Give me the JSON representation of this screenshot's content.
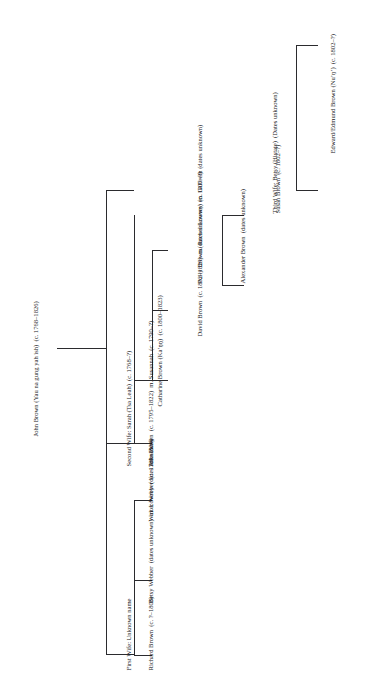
{
  "figure": {
    "type": "genealogy-tree",
    "orientation": "rotated-90-ccw",
    "background_color": "#ffffff",
    "line_color": "#2b2b2e"
  },
  "nodes": {
    "root": {
      "name": "John Brown",
      "native_name": "Yau na gung yah ish",
      "dates": "(c. 1768–1826)"
    },
    "wife1": {
      "label": "First Wife: Unknown name"
    },
    "wife2": {
      "name": "Second Wife: Sarah",
      "native_name": "Tsa Leah",
      "dates": "(c. 1768–?)"
    },
    "wife3": {
      "name": "Third Wife: Betsy",
      "native_name": "Histate",
      "dates": "(Dates unknown)"
    },
    "richard_brown": {
      "name": "Richard Brown",
      "dates": "(c. ?–1808)"
    },
    "betsy_webber": {
      "name": "Betsy Webber",
      "dates": "(dates unknown)",
      "marriage": "m. Lowrey",
      "marriage_dates": "(dates unknown)"
    },
    "walter_webber": {
      "name": "Walter Webber",
      "dates": "(c. 1789–1834)"
    },
    "john_brown_jr": {
      "name": "John Brown",
      "dates": "(c. 1795–1822)",
      "marriage": "m. Susannah",
      "marriage_dates": "(c. 1790–?)"
    },
    "catharine_brown": {
      "name": "Catharine Brown",
      "native_name": "Kaʼŋŋ",
      "dates": "(c. 1800–1823)"
    },
    "david_brown": {
      "name": "David Brown",
      "dates": "(c. 1802–1829)",
      "marriage": "m. Rachel Lowrey",
      "marriage_dates": "(c. 1807–?)"
    },
    "polly_brown": {
      "name": "Polly Brown",
      "dates": "(dates unknown)",
      "marriage": "m. Gilbreth",
      "marriage_dates": "(dates unknown)"
    },
    "alexander_brown": {
      "name": "Alexander Brown",
      "dates": "(dates unknown)"
    },
    "susan_brown": {
      "name": "Susan Brown",
      "dates": "(c. 1802–?)"
    },
    "edward_brown": {
      "name": "Edward/Edmund Brown",
      "native_name": "Nuʼŋʼ",
      "dates": "(c. 1802–?)"
    }
  }
}
